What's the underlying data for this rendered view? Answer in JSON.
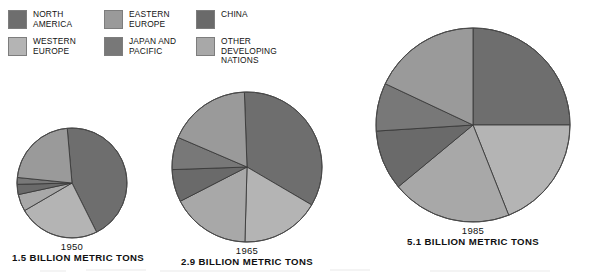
{
  "legend": {
    "items": [
      {
        "label": "NORTH\nAMERICA",
        "key": "north_america",
        "color": "#6e6e6e",
        "swatch_name": "legend-swatch-north-america"
      },
      {
        "label": "EASTERN\nEUROPE",
        "key": "eastern_europe",
        "color": "#9a9a9a",
        "swatch_name": "legend-swatch-eastern-europe"
      },
      {
        "label": "CHINA",
        "key": "china",
        "color": "#6a6a6a",
        "swatch_name": "legend-swatch-china"
      },
      {
        "label": "WESTERN\nEUROPE",
        "key": "western_europe",
        "color": "#b4b4b4",
        "swatch_name": "legend-swatch-western-europe"
      },
      {
        "label": "JAPAN AND\nPACIFIC",
        "key": "japan_pacific",
        "color": "#787878",
        "swatch_name": "legend-swatch-japan-pacific"
      },
      {
        "label": "OTHER DEVELOPING\nNATIONS",
        "key": "other_developing",
        "color": "#a8a8a8",
        "swatch_name": "legend-swatch-other-developing"
      }
    ]
  },
  "chart_data": {
    "type": "pie",
    "title": "",
    "legend_position": "top-left",
    "grid": false,
    "unit": "billion metric tons",
    "series_names": [
      "NORTH AMERICA",
      "WESTERN EUROPE",
      "EASTERN EUROPE",
      "JAPAN AND PACIFIC",
      "CHINA",
      "OTHER DEVELOPING NATIONS"
    ],
    "colors": [
      "#6e6e6e",
      "#b4b4b4",
      "#9a9a9a",
      "#787878",
      "#6a6a6a",
      "#a8a8a8"
    ],
    "charts": [
      {
        "year": "1950",
        "total_label": "1.5 BILLION METRIC TONS",
        "total_value": 1.5,
        "radius_px": 55,
        "categories": [
          "NORTH AMERICA",
          "WESTERN EUROPE",
          "OTHER DEVELOPING NATIONS",
          "CHINA",
          "JAPAN AND PACIFIC",
          "EASTERN EUROPE"
        ],
        "values": [
          44,
          24,
          5,
          3,
          2,
          22
        ],
        "start_angle_deg": -5
      },
      {
        "year": "1965",
        "total_label": "2.9 BILLION METRIC TONS",
        "total_value": 2.9,
        "radius_px": 75,
        "categories": [
          "NORTH AMERICA",
          "WESTERN EUROPE",
          "OTHER DEVELOPING NATIONS",
          "CHINA",
          "JAPAN AND PACIFIC",
          "EASTERN EUROPE"
        ],
        "values": [
          34,
          17,
          17,
          7,
          7,
          18
        ],
        "start_angle_deg": -2
      },
      {
        "year": "1985",
        "total_label": "5.1 BILLION METRIC TONS",
        "total_value": 5.1,
        "radius_px": 97,
        "categories": [
          "NORTH AMERICA",
          "WESTERN EUROPE",
          "OTHER DEVELOPING NATIONS",
          "CHINA",
          "JAPAN AND PACIFIC",
          "EASTERN EUROPE"
        ],
        "values": [
          25,
          19,
          20,
          10,
          8,
          18
        ],
        "start_angle_deg": 0
      }
    ]
  }
}
